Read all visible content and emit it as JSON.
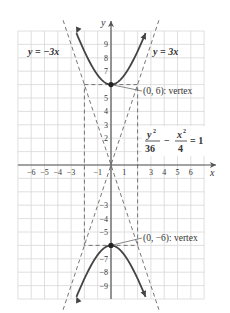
{
  "figure": {
    "axis_labels": {
      "x": "x",
      "y": "y"
    },
    "x_tick_labels": [
      "−6",
      "−5",
      "−4",
      "−3",
      "−1",
      "1",
      "3",
      "4",
      "5",
      "6"
    ],
    "x_tick_values": [
      -6,
      -5,
      -4,
      -3,
      -1,
      1,
      3,
      4,
      5,
      6
    ],
    "y_tick_labels": [
      "9",
      "8",
      "7",
      "5",
      "4",
      "3",
      "2",
      "−3",
      "−4",
      "−5",
      "−7",
      "−8",
      "−9"
    ],
    "y_tick_values": [
      9,
      8,
      7,
      5,
      4,
      3,
      2,
      -3,
      -4,
      -5,
      -7,
      -8,
      -9
    ],
    "x_range": [
      -7,
      7
    ],
    "y_range": [
      -10,
      10
    ],
    "asymptote_left_label": "y = −3x",
    "asymptote_right_label": "y = 3x",
    "asymptote_slopes": [
      -3,
      3
    ],
    "equation": {
      "y_num": "y",
      "y_exp": "2",
      "y_den": "36",
      "minus": "−",
      "x_num": "x",
      "x_exp": "2",
      "x_den": "4",
      "equals": "= 1"
    },
    "hyperbola": {
      "a": 6,
      "b": 2,
      "orientation": "vertical"
    },
    "vertices": [
      {
        "x": 0,
        "y": 6,
        "label": "(0, 6): vertex"
      },
      {
        "x": 0,
        "y": -6,
        "label": "(0, −6): vertex"
      }
    ],
    "box": {
      "x": [
        -2,
        2
      ],
      "y": [
        -6,
        6
      ]
    },
    "colors": {
      "grid": "#d8d8d8",
      "axis": "#555555",
      "curve": "#444444",
      "dash": "#666666"
    }
  }
}
